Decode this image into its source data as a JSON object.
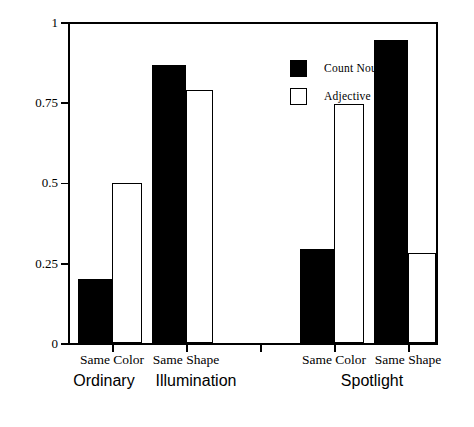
{
  "chart_data": {
    "type": "bar",
    "title": "",
    "xlabel": "",
    "ylabel": "Proportion \"yes\"",
    "ylim": [
      0,
      1
    ],
    "yticks": [
      0,
      0.25,
      0.5,
      0.75,
      1
    ],
    "ytick_labels": [
      "0",
      "0.25",
      "0.5",
      "0.75",
      "1"
    ],
    "grid": false,
    "legend_position": "upper-center",
    "categories": [
      "Same Color",
      "Same Shape",
      "Same Color",
      "Same Shape"
    ],
    "groups": [
      {
        "name": "Ordinary Illumination",
        "line1": "Ordinary",
        "line2": "Illumination",
        "categories": [
          "Same Color",
          "Same Shape"
        ]
      },
      {
        "name": "Spotlight",
        "line1": "Spotlight",
        "line2": "",
        "categories": [
          "Same Color",
          "Same Shape"
        ]
      }
    ],
    "series": [
      {
        "name": "Count Noun",
        "color": "#000000",
        "fill": "solid",
        "values": [
          0.2,
          0.865,
          0.295,
          0.945
        ]
      },
      {
        "name": "Adjective",
        "color": "#ffffff",
        "fill": "open",
        "values": [
          0.5,
          0.79,
          0.745,
          0.28
        ]
      }
    ]
  },
  "axis": {
    "ylabel": "Proportion \"yes\"",
    "ytick_labels": [
      "1",
      "0.75",
      "0.5",
      "0.25",
      "0"
    ]
  },
  "legend": {
    "items": [
      {
        "label": "Count Noun",
        "style": "filled"
      },
      {
        "label": "Adjective",
        "style": "open"
      }
    ]
  },
  "xaxis": {
    "condition_labels": [
      "Same Color",
      "Same Shape",
      "Same Color",
      "Same Shape"
    ],
    "group_labels": [
      "Ordinary",
      "Illumination",
      "Spotlight"
    ]
  }
}
